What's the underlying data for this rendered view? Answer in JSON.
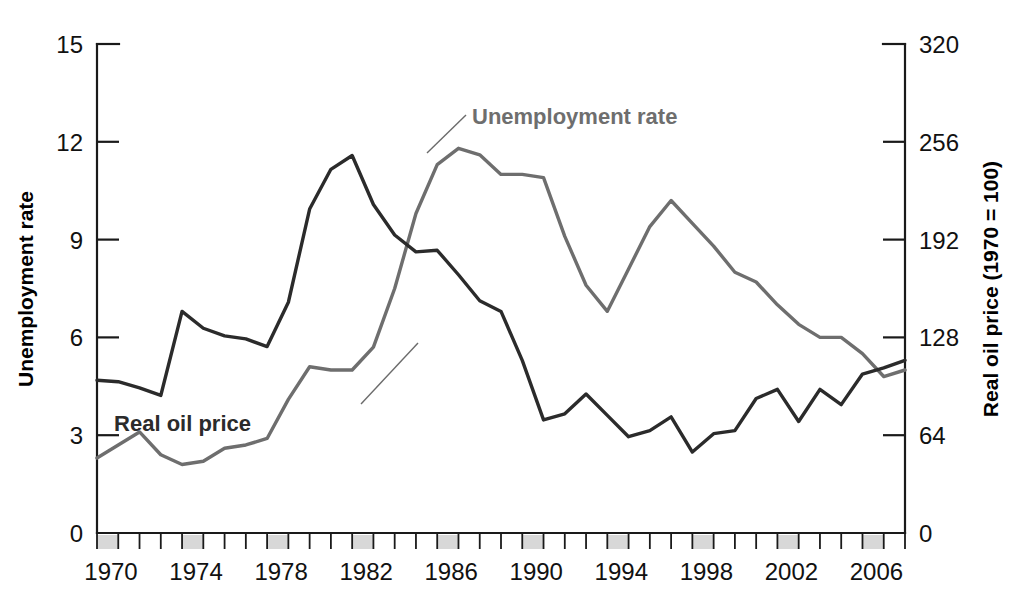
{
  "chart_data": {
    "type": "line",
    "title": "",
    "xlabel": "",
    "x": [
      1970,
      1971,
      1972,
      1973,
      1974,
      1975,
      1976,
      1977,
      1978,
      1979,
      1980,
      1981,
      1982,
      1983,
      1984,
      1985,
      1986,
      1987,
      1988,
      1989,
      1990,
      1991,
      1992,
      1993,
      1994,
      1995,
      1996,
      1997,
      1998,
      1999,
      2000,
      2001,
      2002,
      2003,
      2004,
      2005,
      2006,
      2007,
      2008
    ],
    "xlim": [
      1970,
      2008
    ],
    "xtick_labels": [
      "1970",
      "1974",
      "1978",
      "1982",
      "1986",
      "1990",
      "1994",
      "1998",
      "2002",
      "2006"
    ],
    "xtick_values": [
      1970,
      1974,
      1978,
      1982,
      1986,
      1990,
      1994,
      1998,
      2002,
      2006
    ],
    "grid": false,
    "legend_position": "inline-annotation",
    "recession_bands": [
      {
        "start": 1970,
        "end": 1971
      },
      {
        "start": 1974,
        "end": 1975
      },
      {
        "start": 1978,
        "end": 1979
      },
      {
        "start": 1982,
        "end": 1983
      },
      {
        "start": 1986,
        "end": 1987
      },
      {
        "start": 1990,
        "end": 1991
      },
      {
        "start": 1994,
        "end": 1995
      },
      {
        "start": 1998,
        "end": 1999
      },
      {
        "start": 2002,
        "end": 2003
      },
      {
        "start": 2006,
        "end": 2007
      }
    ],
    "axes": {
      "left": {
        "label": "Unemployment rate",
        "ticks": [
          0,
          3,
          6,
          9,
          12,
          15
        ],
        "tick_labels": [
          "0",
          "3",
          "6",
          "9",
          "12",
          "15"
        ],
        "lim": [
          0,
          15
        ]
      },
      "right": {
        "label": "Real oil price (1970 = 100)",
        "ticks": [
          0,
          64,
          128,
          192,
          256,
          320
        ],
        "tick_labels": [
          "0",
          "64",
          "128",
          "192",
          "256",
          "320"
        ],
        "lim": [
          0,
          320
        ]
      }
    },
    "series": [
      {
        "name": "Unemployment rate",
        "axis": "left",
        "color": "#6e6e6e",
        "stroke_width": 3.4,
        "label_text": "Unemployment rate",
        "values": [
          2.3,
          2.7,
          3.1,
          2.4,
          2.1,
          2.2,
          2.6,
          2.7,
          2.9,
          4.1,
          5.1,
          5.0,
          5.0,
          5.7,
          7.5,
          9.8,
          11.3,
          11.8,
          11.6,
          11.0,
          11.0,
          10.9,
          9.1,
          7.6,
          6.8,
          8.1,
          9.4,
          10.2,
          9.5,
          8.8,
          8.0,
          7.7,
          7.0,
          6.4,
          6.0,
          6.0,
          5.5,
          4.8,
          5.0
        ]
      },
      {
        "name": "Real oil price",
        "axis": "right",
        "color": "#2b2b2b",
        "stroke_width": 3.4,
        "label_text": "Real oil price",
        "values": [
          100,
          99,
          95,
          90,
          145,
          134,
          129,
          127,
          122,
          151,
          212,
          238,
          247,
          215,
          195,
          184,
          185,
          169,
          152,
          145,
          113,
          74,
          78,
          91,
          77,
          63,
          67,
          76,
          53,
          65,
          67,
          88,
          94,
          73,
          94,
          84,
          104,
          108,
          113
        ]
      }
    ],
    "series_oil_left_scale_note": "",
    "annotations": [
      {
        "text": "Unemployment rate",
        "x_px": 470,
        "y_px": 122
      },
      {
        "text": "Real oil price",
        "x_px": 253,
        "y_px": 430
      }
    ]
  },
  "meta": {
    "left_axis_title": "Unemployment rate",
    "right_axis_title": "Real oil price (1970 = 100)",
    "label_unemployment": "Unemployment rate",
    "label_oil": "Real oil price",
    "color_unemployment": "#6e6e6e",
    "color_oil": "#2b2b2b",
    "color_recession_band": "#d8d8d8",
    "color_axis": "#1a1a1a"
  }
}
